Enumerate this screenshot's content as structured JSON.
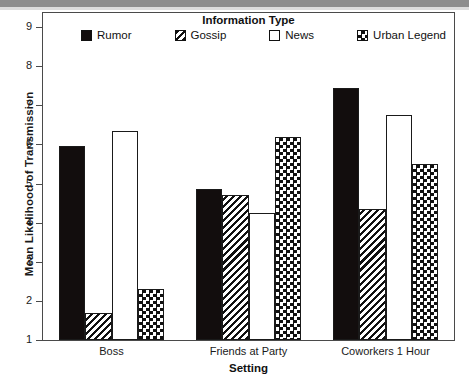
{
  "chart_data": {
    "type": "bar",
    "title": "",
    "xlabel": "Setting",
    "ylabel": "Mean Likelihood of Transmission",
    "legend_title": "Information Type",
    "legend_position": "top-inside",
    "grid": false,
    "ylim": [
      1,
      9
    ],
    "yticks": [
      1,
      2,
      3,
      4,
      5,
      6,
      7,
      8,
      9
    ],
    "ytick_labels": [
      "1",
      "2",
      "3",
      "4",
      "5",
      "6",
      "7",
      "8",
      "9"
    ],
    "categories": [
      "Boss",
      "Friends at Party",
      "Coworkers 1 Hour"
    ],
    "series": [
      {
        "name": "Rumor",
        "pattern": "solid-black",
        "values": [
          5.95,
          4.85,
          7.45
        ]
      },
      {
        "name": "Gossip",
        "pattern": "diagonal-stripes",
        "values": [
          1.7,
          4.7,
          4.35
        ]
      },
      {
        "name": "News",
        "pattern": "open-white",
        "values": [
          6.35,
          4.25,
          6.75
        ]
      },
      {
        "name": "Urban Legend",
        "pattern": "checkerboard",
        "values": [
          2.3,
          6.2,
          5.5
        ]
      }
    ],
    "colors": {
      "axis": "#4a4a4a",
      "text": "#1a1a1a",
      "bar_outline": "#1a1a1a",
      "bar_solid_fill": "#120d0d",
      "background": "#ffffff"
    }
  }
}
